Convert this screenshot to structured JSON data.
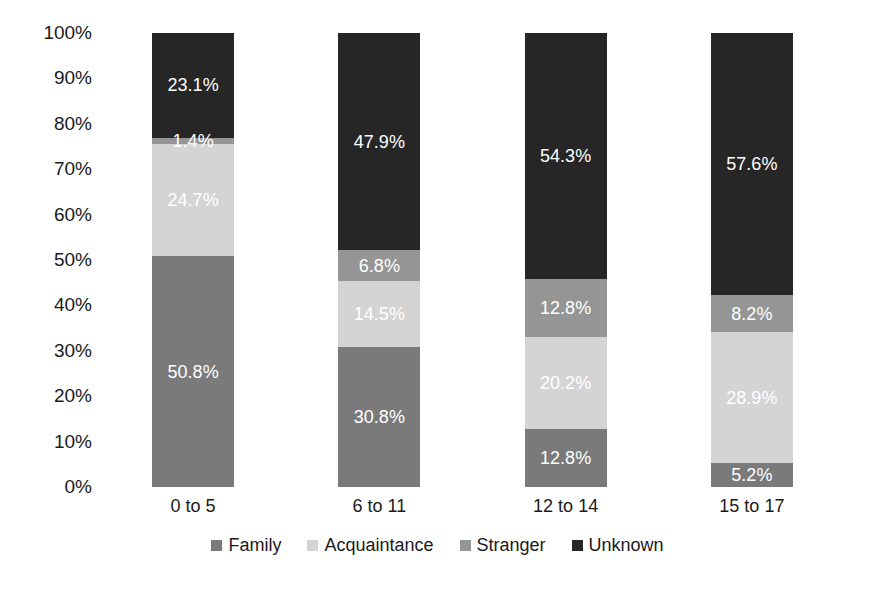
{
  "chart_data": {
    "type": "bar",
    "subtype": "100% stacked column",
    "title": "",
    "xlabel": "",
    "ylabel": "",
    "ylim": [
      0,
      100
    ],
    "grid": false,
    "legend_position": "bottom",
    "value_suffix": "%",
    "categories": [
      "0 to 5",
      "6 to 11",
      "12 to 14",
      "15 to 17"
    ],
    "series": [
      {
        "name": "Family",
        "color": "#7a7a7a",
        "values": [
          50.8,
          30.8,
          12.8,
          5.2
        ],
        "labels": [
          "50.8%",
          "30.8%",
          "12.8%",
          "5.2%"
        ]
      },
      {
        "name": "Acquaintance",
        "color": "#d4d4d4",
        "values": [
          24.7,
          14.5,
          20.2,
          28.9
        ],
        "labels": [
          "24.7%",
          "14.5%",
          "20.2%",
          "28.9%"
        ]
      },
      {
        "name": "Stranger",
        "color": "#959595",
        "values": [
          1.4,
          6.8,
          12.8,
          8.2
        ],
        "labels": [
          "1.4%",
          "6.8%",
          "12.8%",
          "8.2%"
        ]
      },
      {
        "name": "Unknown",
        "color": "#262626",
        "values": [
          23.1,
          47.9,
          54.3,
          57.6
        ],
        "labels": [
          "23.1%",
          "47.9%",
          "54.3%",
          "57.6%"
        ]
      }
    ],
    "y_ticks": [
      "0%",
      "10%",
      "20%",
      "30%",
      "40%",
      "50%",
      "60%",
      "70%",
      "80%",
      "90%",
      "100%"
    ],
    "y_tick_values": [
      0,
      10,
      20,
      30,
      40,
      50,
      60,
      70,
      80,
      90,
      100
    ]
  },
  "legend": {
    "items": [
      {
        "label": "Family",
        "color": "#7a7a7a"
      },
      {
        "label": "Acquaintance",
        "color": "#d4d4d4"
      },
      {
        "label": "Stranger",
        "color": "#959595"
      },
      {
        "label": "Unknown",
        "color": "#262626"
      }
    ]
  }
}
